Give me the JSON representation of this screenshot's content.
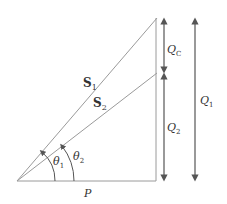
{
  "diagram": {
    "type": "power-triangle",
    "colors": {
      "line": "#9a9a9a",
      "arrow": "#555555",
      "text": "#333333"
    },
    "labels": {
      "s1": {
        "main": "S",
        "sub": "1"
      },
      "s2": {
        "main": "S",
        "sub": "2"
      },
      "theta1": {
        "main": "θ",
        "sub": "1"
      },
      "theta2": {
        "main": "θ",
        "sub": "2"
      },
      "p": "P",
      "qc": {
        "main": "Q",
        "sub": "C"
      },
      "q2": {
        "main": "Q",
        "sub": "2"
      },
      "q1": {
        "main": "Q",
        "sub": "1"
      }
    },
    "geometry": {
      "origin": [
        17,
        181
      ],
      "base_end": [
        156,
        181
      ],
      "s1_end": [
        157,
        18
      ],
      "s2_end": [
        157,
        73
      ]
    }
  }
}
